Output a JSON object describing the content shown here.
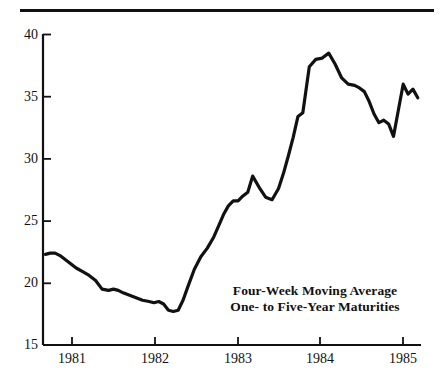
{
  "chart_data": {
    "type": "line",
    "title": "",
    "subtitle": "",
    "xlabel": "",
    "ylabel": "",
    "xlim": [
      1980.63,
      1985.3
    ],
    "ylim": [
      15,
      40
    ],
    "grid": false,
    "legend_position": "none",
    "annotations": [
      "Four-Week Moving Average",
      "One- to Five-Year Maturities"
    ],
    "y_ticks": [
      15,
      20,
      25,
      30,
      35,
      40
    ],
    "y_tick_labels": [
      "15",
      "20",
      "25",
      "30",
      "35",
      "40"
    ],
    "x_ticks": [
      1981,
      1982,
      1983,
      1984,
      1985
    ],
    "x_tick_labels": [
      "1981",
      "1982",
      "1983",
      "1984",
      "1985"
    ],
    "series": [
      {
        "name": "Four-Week Moving Average, One- to Five-Year Maturities",
        "color": "#111111",
        "x": [
          1980.66,
          1980.72,
          1980.78,
          1980.84,
          1980.9,
          1980.96,
          1981.04,
          1981.12,
          1981.2,
          1981.28,
          1981.36,
          1981.44,
          1981.5,
          1981.56,
          1981.62,
          1981.7,
          1981.78,
          1981.86,
          1981.94,
          1982.0,
          1982.06,
          1982.12,
          1982.18,
          1982.24,
          1982.3,
          1982.36,
          1982.42,
          1982.5,
          1982.58,
          1982.66,
          1982.74,
          1982.8,
          1982.86,
          1982.92,
          1982.98,
          1983.04,
          1983.1,
          1983.16,
          1983.22,
          1983.3,
          1983.38,
          1983.46,
          1983.54,
          1983.6,
          1983.66,
          1983.72,
          1983.78,
          1983.84,
          1983.92,
          1984.0,
          1984.08,
          1984.16,
          1984.24,
          1984.32,
          1984.4,
          1984.48,
          1984.54,
          1984.6,
          1984.66,
          1984.72,
          1984.78,
          1984.84,
          1984.9,
          1984.96,
          1985.02,
          1985.08,
          1985.14,
          1985.2,
          1985.26
        ],
        "y": [
          22.3,
          22.4,
          22.4,
          22.2,
          21.9,
          21.6,
          21.2,
          20.9,
          20.6,
          20.2,
          19.5,
          19.4,
          19.5,
          19.4,
          19.2,
          19.0,
          18.8,
          18.6,
          18.5,
          18.4,
          18.5,
          18.3,
          17.8,
          17.7,
          17.8,
          18.6,
          19.7,
          21.1,
          22.1,
          22.8,
          23.7,
          24.6,
          25.5,
          26.2,
          26.6,
          26.6,
          27.0,
          27.3,
          28.6,
          27.7,
          26.9,
          26.7,
          27.6,
          28.8,
          30.2,
          31.7,
          33.4,
          33.7,
          37.4,
          38.0,
          38.1,
          38.5,
          37.6,
          36.5,
          36.0,
          35.9,
          35.7,
          35.4,
          34.6,
          33.6,
          32.9,
          33.1,
          32.8,
          31.8,
          33.9,
          36.0,
          35.2,
          35.6,
          34.9
        ]
      }
    ]
  },
  "axis": {
    "y_label_15": "15",
    "y_label_20": "20",
    "y_label_25": "25",
    "y_label_30": "30",
    "y_label_35": "35",
    "y_label_40": "40",
    "x_label_1981": "1981",
    "x_label_1982": "1982",
    "x_label_1983": "1983",
    "x_label_1984": "1984",
    "x_label_1985": "1985"
  },
  "annotation": {
    "line1": "Four-Week Moving Average",
    "line2": "One- to Five-Year Maturities"
  },
  "colors": {
    "ink": "#111111",
    "background": "#ffffff"
  }
}
